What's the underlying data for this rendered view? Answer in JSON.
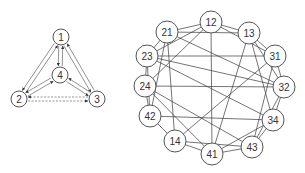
{
  "diagram": {
    "left_graph": {
      "name": "directed-graph",
      "node_radius": 8,
      "nodes": [
        {
          "id": "1",
          "label": "1",
          "x": 61,
          "y": 37
        },
        {
          "id": "4",
          "label": "4",
          "x": 60,
          "y": 75
        },
        {
          "id": "2",
          "label": "2",
          "x": 19,
          "y": 99
        },
        {
          "id": "3",
          "label": "3",
          "x": 97,
          "y": 99
        }
      ],
      "edges": [
        {
          "from": "1",
          "to": "2",
          "style": "solid"
        },
        {
          "from": "2",
          "to": "1",
          "style": "solid"
        },
        {
          "from": "1",
          "to": "3",
          "style": "solid"
        },
        {
          "from": "3",
          "to": "1",
          "style": "solid"
        },
        {
          "from": "1",
          "to": "4",
          "style": "solid"
        },
        {
          "from": "4",
          "to": "1",
          "style": "solid"
        },
        {
          "from": "2",
          "to": "4",
          "style": "solid"
        },
        {
          "from": "4",
          "to": "2",
          "style": "solid"
        },
        {
          "from": "3",
          "to": "4",
          "style": "solid"
        },
        {
          "from": "4",
          "to": "3",
          "style": "solid"
        },
        {
          "from": "2",
          "to": "3",
          "style": "dashed"
        },
        {
          "from": "3",
          "to": "2",
          "style": "dashed"
        }
      ]
    },
    "right_graph": {
      "name": "line-graph",
      "node_radius": 11,
      "nodes": [
        {
          "id": "12",
          "label": "12",
          "x": 211,
          "y": 22
        },
        {
          "id": "13",
          "label": "13",
          "x": 249,
          "y": 33
        },
        {
          "id": "31",
          "label": "31",
          "x": 275,
          "y": 56
        },
        {
          "id": "32",
          "label": "32",
          "x": 284,
          "y": 87
        },
        {
          "id": "34",
          "label": "34",
          "x": 273,
          "y": 120
        },
        {
          "id": "43",
          "label": "43",
          "x": 252,
          "y": 147
        },
        {
          "id": "41",
          "label": "41",
          "x": 212,
          "y": 154
        },
        {
          "id": "14",
          "label": "14",
          "x": 175,
          "y": 141
        },
        {
          "id": "42",
          "label": "42",
          "x": 150,
          "y": 116
        },
        {
          "id": "24",
          "label": "24",
          "x": 145,
          "y": 86
        },
        {
          "id": "23",
          "label": "23",
          "x": 147,
          "y": 56
        },
        {
          "id": "21",
          "label": "21",
          "x": 167,
          "y": 32
        }
      ]
    }
  }
}
